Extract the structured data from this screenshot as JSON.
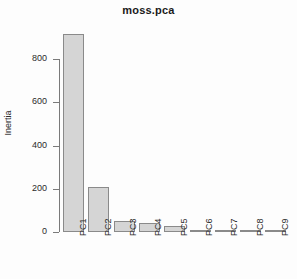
{
  "chart_data": {
    "type": "bar",
    "title": "moss.pca",
    "xlabel": "",
    "ylabel": "Inertia",
    "categories": [
      "PC1",
      "PC2",
      "PC3",
      "PC4",
      "PC5",
      "PC6",
      "PC7",
      "PC8",
      "PC9"
    ],
    "values": [
      914,
      209,
      51,
      42,
      28,
      7,
      5,
      3,
      1
    ],
    "ylim": [
      0,
      940
    ],
    "yticks": [
      0,
      200,
      400,
      600,
      800
    ],
    "ytick_labels": [
      "0",
      "200",
      "400",
      "600",
      "800"
    ],
    "grid": false,
    "legend": null,
    "bar_fill_color": "#d5d5d5",
    "bar_border_color": "#8a8a8a",
    "axis_color": "#7a7a7a",
    "background_color": "#fdfdfd"
  }
}
